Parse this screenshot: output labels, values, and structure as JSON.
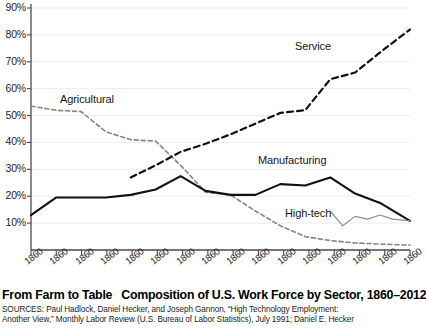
{
  "chart_data": {
    "type": "line",
    "title": "Composition of U.S. Work Force by Sector, 1860–2012",
    "kicker": "From Farm to Table",
    "xlabel": "",
    "ylabel": "",
    "ylim": [
      0,
      95
    ],
    "xlim": [
      1860,
      2012
    ],
    "grid": true,
    "legend_position": "inline-annotations",
    "ytick_labels": [
      "10%",
      "20%",
      "30%",
      "40%",
      "50%",
      "60%",
      "70%",
      "80%",
      "90%"
    ],
    "ytick_values": [
      10,
      20,
      30,
      40,
      50,
      60,
      70,
      80,
      90
    ],
    "xtick_labels": [
      "1860",
      "1860",
      "1860",
      "1860",
      "1860",
      "1860",
      "1860",
      "1860",
      "1860",
      "1860",
      "1860",
      "1860",
      "1860",
      "1860",
      "1860",
      "1860"
    ],
    "x": [
      1860,
      1870,
      1880,
      1890,
      1900,
      1910,
      1920,
      1930,
      1940,
      1950,
      1960,
      1970,
      1980,
      1990,
      2000,
      2012
    ],
    "series": [
      {
        "name": "Agricultural",
        "style": "dashed",
        "color": "#8a8a8a",
        "x": [
          1860,
          1870,
          1880,
          1890,
          1900,
          1910,
          1920,
          1930,
          1940,
          1950,
          1960,
          1970,
          1980,
          1990,
          2000,
          2012
        ],
        "values": [
          53.5,
          52.0,
          51.5,
          44.0,
          41.0,
          40.5,
          31.5,
          21.5,
          20.5,
          14.5,
          9.0,
          5.0,
          3.5,
          2.6,
          2.2,
          1.8
        ]
      },
      {
        "name": "Manufacturing",
        "style": "solid",
        "color": "#111111",
        "x": [
          1860,
          1870,
          1880,
          1890,
          1900,
          1910,
          1920,
          1930,
          1940,
          1950,
          1960,
          1970,
          1980,
          1990,
          2000,
          2012
        ],
        "values": [
          13.0,
          19.5,
          19.5,
          19.5,
          20.5,
          22.5,
          27.5,
          22.0,
          20.5,
          20.5,
          24.5,
          24.0,
          27.0,
          21.0,
          17.5,
          10.8
        ]
      },
      {
        "name": "Service",
        "style": "dashed",
        "color": "#111111",
        "x": [
          1900,
          1910,
          1920,
          1930,
          1940,
          1950,
          1960,
          1970,
          1980,
          1990,
          2000,
          2012
        ],
        "values": [
          27.0,
          31.5,
          36.5,
          39.5,
          43.0,
          47.0,
          51.0,
          52.0,
          63.5,
          66.0,
          73.5,
          82.0
        ]
      },
      {
        "name": "High-tech",
        "style": "solid-thin",
        "color": "#8e8e8e",
        "x": [
          1980,
          1985,
          1990,
          1995,
          2000,
          2005,
          2012
        ],
        "values": [
          14.5,
          9.0,
          12.5,
          11.5,
          13.0,
          11.5,
          10.8
        ]
      }
    ],
    "annotations": [
      {
        "text": "Agricultural",
        "x_px": 60,
        "y_px": 93
      },
      {
        "text": "Service",
        "x_px": 295,
        "y_px": 40
      },
      {
        "text": "Manufacturing",
        "x_px": 258,
        "y_px": 154
      },
      {
        "text": "High-tech",
        "x_px": 285,
        "y_px": 207
      }
    ]
  },
  "caption": {
    "headline": "From Farm to Table",
    "subhead": "Composition of U.S. Work Force by Sector, 1860–2012",
    "sources_line_1": "SOURCES: Paul Hadlock, Daniel Hecker, and Joseph Gannon, “High Technology Employment:",
    "sources_line_2": "Another View,” Monthly Labor Review (U.S. Bureau of Labor Statistics), July 1991; Daniel E. Hecker"
  },
  "colors": {
    "axis": "#4a4a4a",
    "grid": "#ededed",
    "manufacturing": "#111111",
    "service": "#111111",
    "agricultural": "#8a8a8a",
    "hightech": "#8e8e8e"
  }
}
